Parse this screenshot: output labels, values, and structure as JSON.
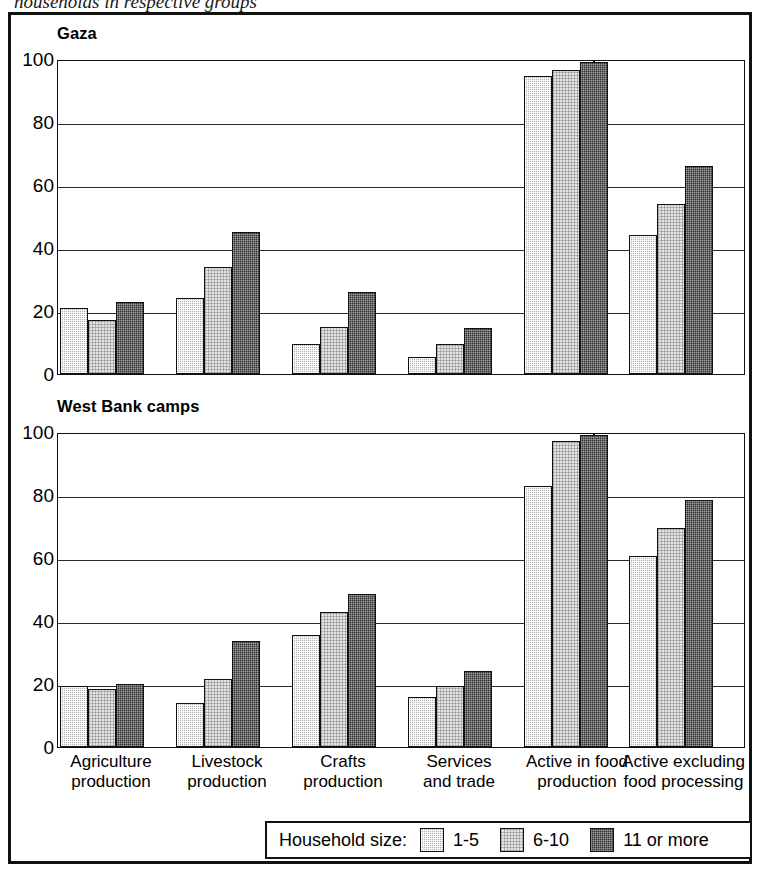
{
  "caption_cut": "households in respective groups",
  "panels": [
    {
      "id": "gaza",
      "title": "Gaza"
    },
    {
      "id": "west-bank-camps",
      "title": "West Bank camps"
    }
  ],
  "y_ticks": [
    "0",
    "20",
    "40",
    "60",
    "80",
    "100"
  ],
  "categories": [
    {
      "line1": "Agriculture",
      "line2": "production"
    },
    {
      "line1": "Livestock",
      "line2": "production"
    },
    {
      "line1": "Crafts",
      "line2": "production"
    },
    {
      "line1": "Services",
      "line2": "and trade"
    },
    {
      "line1": "Active in food",
      "line2": "production"
    },
    {
      "line1": "Active excluding",
      "line2": "food processing"
    }
  ],
  "legend": {
    "title": "Household size:",
    "items": [
      {
        "label": "1-5",
        "swatch": "medium-gray-hatch",
        "color": "#b3b3b3"
      },
      {
        "label": "6-10",
        "swatch": "light-gray-hatch",
        "color": "#e3e3e3"
      },
      {
        "label": "11 or more",
        "swatch": "dark-gray-hatch",
        "color": "#2e2e2e"
      }
    ]
  },
  "chart_data": [
    {
      "type": "bar",
      "title": "Gaza",
      "xlabel": "",
      "ylabel": "",
      "ylim": [
        0,
        100
      ],
      "yticks": [
        0,
        20,
        40,
        60,
        80,
        100
      ],
      "grid": true,
      "legend_position": "bottom",
      "categories": [
        "Agriculture production",
        "Livestock production",
        "Crafts production",
        "Services and trade",
        "Active in food production",
        "Active excluding food processing"
      ],
      "series": [
        {
          "name": "1-5",
          "values": [
            21,
            24,
            9.5,
            5.5,
            94.5,
            44
          ]
        },
        {
          "name": "6-10",
          "values": [
            17,
            34,
            15,
            9.5,
            96.5,
            54
          ]
        },
        {
          "name": "11 or more",
          "values": [
            23,
            45,
            26,
            14.5,
            99,
            66
          ]
        }
      ]
    },
    {
      "type": "bar",
      "title": "West Bank camps",
      "xlabel": "",
      "ylabel": "",
      "ylim": [
        0,
        100
      ],
      "yticks": [
        0,
        20,
        40,
        60,
        80,
        100
      ],
      "grid": true,
      "legend_position": "bottom",
      "categories": [
        "Agriculture production",
        "Livestock production",
        "Crafts production",
        "Services and trade",
        "Active in food production",
        "Active excluding food processing"
      ],
      "series": [
        {
          "name": "1-5",
          "values": [
            19.5,
            14,
            35.5,
            16,
            83,
            60.5
          ]
        },
        {
          "name": "6-10",
          "values": [
            18.5,
            21.5,
            43,
            19.5,
            97,
            69.5
          ]
        },
        {
          "name": "11 or more",
          "values": [
            20,
            33.5,
            48.5,
            24,
            99,
            78.5
          ]
        }
      ]
    }
  ]
}
